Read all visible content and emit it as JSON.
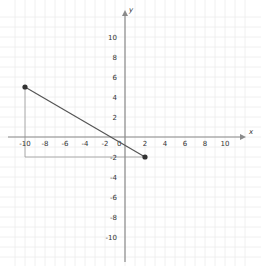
{
  "chart_data": {
    "type": "line",
    "title": "",
    "xlabel": "x",
    "ylabel": "y",
    "xlim": [
      -11.5,
      12
    ],
    "ylim": [
      -12,
      12.5
    ],
    "grid": true,
    "x_ticks": [
      -10,
      -8,
      -6,
      -4,
      -2,
      2,
      4,
      6,
      8,
      10
    ],
    "y_ticks": [
      10,
      8,
      6,
      4,
      2,
      -2,
      -4,
      -6,
      -8,
      -10
    ],
    "x_tick_labels": [
      "-10",
      "-8",
      "-6",
      "-4",
      "-2",
      "2",
      "4",
      "6",
      "8",
      "10"
    ],
    "y_tick_labels": [
      "10",
      "8",
      "6",
      "4",
      "2",
      "-2",
      "-4",
      "-6",
      "-8",
      "-10"
    ],
    "origin_label": "0",
    "points": [
      {
        "x": -10,
        "y": 5
      },
      {
        "x": 2,
        "y": -2
      }
    ],
    "segments": [
      {
        "from": {
          "x": -10,
          "y": 5
        },
        "to": {
          "x": 2,
          "y": -2
        },
        "style": "solid"
      }
    ],
    "guide_lines": [
      {
        "from": {
          "x": -10,
          "y": 5
        },
        "to": {
          "x": -10,
          "y": -2
        }
      },
      {
        "from": {
          "x": -10,
          "y": -2
        },
        "to": {
          "x": 2,
          "y": -2
        }
      }
    ]
  },
  "labels": {
    "x_axis": "x",
    "y_axis": "y",
    "origin": "0"
  }
}
